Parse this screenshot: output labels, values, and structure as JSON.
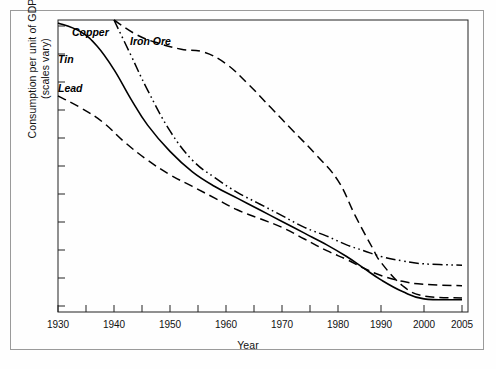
{
  "chart_data": {
    "type": "line",
    "title": "",
    "xlabel": "Year",
    "ylabel_line1": "Consumption per unit of GDP",
    "ylabel_line2": "(scales vary)",
    "xlim": [
      1930,
      2005
    ],
    "ylim": [
      0,
      100
    ],
    "grid": false,
    "legend": "inline-labels",
    "y_axis_note": "scales vary; tick marks unlabeled",
    "y_tick_count": 11,
    "x_tick_labels": [
      "1930",
      "1940",
      "1950",
      "1960",
      "1970",
      "1980",
      "1990",
      "2000",
      "2005"
    ],
    "x_minor_ticks": [
      1935,
      1945,
      1955,
      1965,
      1975
    ],
    "series": [
      {
        "name": "Copper",
        "style": "solid",
        "x": [
          1930,
          1934,
          1937,
          1940,
          1943,
          1946,
          1950,
          1954,
          1958,
          1962,
          1966,
          1970,
          1974,
          1978,
          1982,
          1986,
          1990,
          1995,
          2000,
          2005
        ],
        "values": [
          99,
          96,
          91,
          83,
          73,
          64,
          55,
          48,
          43,
          39,
          35,
          31,
          27,
          23,
          19,
          15,
          11,
          7,
          4.5,
          4.2
        ]
      },
      {
        "name": "Tin",
        "style": "dash-dot-dot",
        "x": [
          1940,
          1943,
          1946,
          1950,
          1954,
          1958,
          1962,
          1966,
          1970,
          1974,
          1978,
          1982,
          1986,
          1990,
          1995,
          2000,
          2005
        ],
        "values": [
          100,
          88,
          76,
          62,
          52,
          46,
          41,
          37,
          33,
          29,
          26,
          23,
          21,
          19,
          17.5,
          16.5,
          16
        ]
      },
      {
        "name": "Lead",
        "style": "long-dash",
        "x": [
          1930,
          1934,
          1938,
          1942,
          1946,
          1950,
          1954,
          1958,
          1962,
          1966,
          1970,
          1974,
          1978,
          1982,
          1986,
          1990,
          1995,
          2000,
          2005
        ],
        "values": [
          74,
          70,
          65,
          58,
          52,
          47,
          43,
          39,
          35,
          32,
          29,
          25,
          21,
          18,
          15,
          12.5,
          10.5,
          9.5,
          9
        ]
      },
      {
        "name": "Iron Ore",
        "style": "long-dash",
        "x": [
          1940,
          1944,
          1948,
          1952,
          1956,
          1960,
          1964,
          1968,
          1972,
          1976,
          1980,
          1984,
          1988,
          1990,
          1995,
          2000,
          2005
        ],
        "values": [
          100,
          95,
          92,
          90,
          89,
          85,
          78,
          70,
          62,
          54,
          45,
          33,
          22,
          17,
          9,
          5.5,
          4.8
        ]
      }
    ],
    "series_label_positions": [
      {
        "name": "Copper",
        "left": 72,
        "top": 26
      },
      {
        "name": "Tin",
        "left": 58,
        "top": 53
      },
      {
        "name": "Lead",
        "left": 58,
        "top": 82
      },
      {
        "name": "Iron Ore",
        "left": 130,
        "top": 35
      }
    ]
  },
  "labels": {
    "copper": "Copper",
    "tin": "Tin",
    "lead": "Lead",
    "iron_ore": "Iron Ore",
    "x_axis": "Year",
    "y_axis_line1": "Consumption per unit of GDP",
    "y_axis_line2": "(scales vary)"
  },
  "ticks": {
    "x": [
      {
        "label": "1930",
        "px": 58
      },
      {
        "label": "1940",
        "px": 114
      },
      {
        "label": "1950",
        "px": 170
      },
      {
        "label": "1960",
        "px": 226
      },
      {
        "label": "1970",
        "px": 282
      },
      {
        "label": "1980",
        "px": 338
      },
      {
        "label": "1990",
        "px": 381
      },
      {
        "label": "2000",
        "px": 424
      },
      {
        "label": "2005",
        "px": 462
      }
    ]
  },
  "colors": {
    "line": "#000000",
    "frame": "#222222",
    "outer_border": "#9a9a9a",
    "background": "#ffffff"
  }
}
